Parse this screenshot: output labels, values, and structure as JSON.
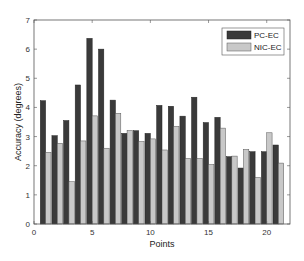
{
  "chart_data": {
    "type": "bar",
    "title": "",
    "xlabel": "Points",
    "ylabel": "Accuracy (degrees)",
    "xlim": [
      0,
      22
    ],
    "ylim": [
      0,
      7
    ],
    "xticks": [
      0,
      5,
      10,
      15,
      20
    ],
    "yticks": [
      0,
      1,
      2,
      3,
      4,
      5,
      6,
      7
    ],
    "grid": false,
    "legend_position": "upper right",
    "categories": [
      1,
      2,
      3,
      4,
      5,
      6,
      7,
      8,
      9,
      10,
      11,
      12,
      13,
      14,
      15,
      16,
      17,
      18,
      19,
      20,
      21
    ],
    "series": [
      {
        "name": "PC-EC",
        "color": "#3a3a3a",
        "values": [
          4.23,
          3.03,
          3.55,
          4.77,
          6.37,
          6.0,
          4.25,
          3.11,
          3.2,
          3.11,
          4.07,
          4.04,
          3.7,
          4.35,
          3.48,
          3.66,
          2.31,
          1.92,
          2.48,
          2.48,
          2.71
        ]
      },
      {
        "name": "NIC-EC",
        "color": "#c8c8c8",
        "values": [
          2.46,
          2.77,
          1.45,
          2.85,
          3.71,
          2.6,
          3.8,
          3.21,
          2.83,
          2.92,
          2.54,
          3.35,
          2.25,
          2.25,
          2.04,
          3.29,
          2.33,
          2.56,
          1.6,
          3.13,
          2.09
        ]
      }
    ]
  },
  "legend": {
    "items": [
      {
        "label": "PC-EC",
        "color": "#3a3a3a"
      },
      {
        "label": "NIC-EC",
        "color": "#c8c8c8"
      }
    ]
  }
}
